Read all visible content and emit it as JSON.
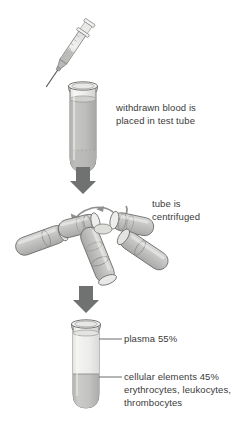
{
  "diagram": {
    "steps": [
      {
        "id": "step-1",
        "caption": "withdrawn blood is\nplaced in test tube",
        "elements": [
          "syringe",
          "test-tube-whole-blood"
        ]
      },
      {
        "id": "step-2",
        "caption": "tube is\ncentrifuged",
        "elements": [
          "centrifuge-rotor",
          "rotation-arrow"
        ]
      },
      {
        "id": "step-3",
        "caption": null,
        "elements": [
          "test-tube-separated"
        ]
      }
    ],
    "labels": {
      "plasma": "plasma 55%",
      "cellular": "cellular elements 45%\nerythrocytes, leukocytes,\nthrombocytes"
    },
    "colors": {
      "background": "#ffffff",
      "outline": "#6c6c6c",
      "arrow": "#6f7270",
      "whole_blood": "#bcbdbb",
      "plasma_layer": "#eeeeec",
      "cellular_layer": "#c2c3c1",
      "glass": "#f4f4f2",
      "text": "#3a3a3a",
      "rotor_tube": "#c9cac7"
    }
  }
}
